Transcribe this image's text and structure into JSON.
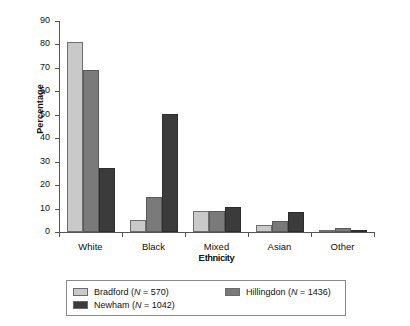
{
  "chart_data": {
    "type": "bar",
    "title": "",
    "xlabel": "Ethnicity",
    "ylabel": "Percentage",
    "ylim": [
      0,
      90
    ],
    "ytick_step": 10,
    "yticks": [
      90,
      80,
      70,
      60,
      50,
      40,
      30,
      20,
      10,
      0
    ],
    "grid": false,
    "legend_position": "bottom",
    "categories": [
      "White",
      "Black",
      "Mixed Ethnicity",
      "Asian",
      "Other"
    ],
    "category_lines": [
      [
        "White"
      ],
      [
        "Black"
      ],
      [
        "Mixed",
        "Ethnicity"
      ],
      [
        "Asian"
      ],
      [
        "Other"
      ]
    ],
    "series": [
      {
        "name": "Bradford",
        "n": 570,
        "legend_label": "Bradford (N = 570)",
        "color": "#c9c9c9",
        "values": [
          81,
          5,
          9,
          3,
          1
        ]
      },
      {
        "name": "Hillingdon",
        "n": 1436,
        "legend_label": "Hillingdon (N = 1436)",
        "color": "#7a7a7a",
        "values": [
          69,
          15,
          9,
          4.5,
          1.5
        ]
      },
      {
        "name": "Newham",
        "n": 1042,
        "legend_label": "Newham (N = 1042)",
        "color": "#3b3b3b",
        "values": [
          27.5,
          50.5,
          10.5,
          8.5,
          1
        ]
      }
    ]
  },
  "axis": {
    "y_title": "Percentage",
    "x_title": "Ethnicity",
    "tick_0": "0",
    "tick_10": "10",
    "tick_20": "20",
    "tick_30": "30",
    "tick_40": "40",
    "tick_50": "50",
    "tick_60": "60",
    "tick_70": "70",
    "tick_80": "80",
    "tick_90": "90"
  },
  "legend": {
    "items": [
      {
        "label": "Bradford (N = 570)",
        "swatch": "s0"
      },
      {
        "label": "Hillingdon (N = 1436)",
        "swatch": "s1"
      },
      {
        "label": "Newham (N = 1042)",
        "swatch": "s2"
      }
    ]
  }
}
